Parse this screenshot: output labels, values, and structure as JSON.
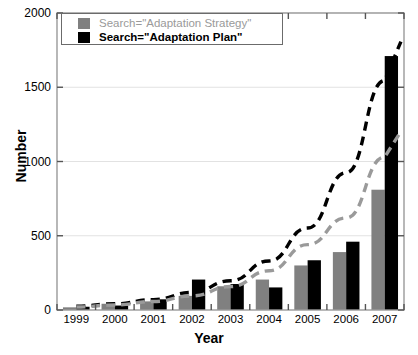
{
  "chart_data": {
    "type": "bar",
    "title": "",
    "xlabel": "Year",
    "ylabel": "Number",
    "ylim": [
      0,
      2000
    ],
    "yticks": [
      0,
      500,
      1000,
      1500,
      2000
    ],
    "ytick_labels": [
      "0",
      "500",
      "1000",
      "1500",
      "2000"
    ],
    "grid": true,
    "legend_position": "top-left",
    "categories": [
      "1999",
      "2000",
      "2001",
      "2002",
      "2003",
      "2004",
      "2005",
      "2006",
      "2007"
    ],
    "series": [
      {
        "name": "Search=\"Adaptation Strategy\"",
        "color": "#808080",
        "values": [
          18,
          42,
          58,
          95,
          160,
          205,
          300,
          390,
          810
        ]
      },
      {
        "name": "Search=\"Adaptation Plan\"",
        "color": "#000000",
        "values": [
          22,
          30,
          72,
          205,
          175,
          152,
          335,
          460,
          1710
        ]
      }
    ],
    "trendlines": [
      {
        "name": "Adaptation Plan trend",
        "color": "#000000",
        "style": "dashed",
        "x": [
          "1999",
          "2000",
          "2001",
          "2002",
          "2003",
          "2004",
          "2005",
          "2006",
          "2007"
        ],
        "values": [
          25,
          42,
          70,
          118,
          197,
          330,
          552,
          924,
          1546
        ]
      },
      {
        "name": "Adaptation Strategy trend",
        "color": "#9a9a9a",
        "style": "dashed",
        "x": [
          "1999",
          "2000",
          "2001",
          "2002",
          "2003",
          "2004",
          "2005",
          "2006",
          "2007"
        ],
        "values": [
          20,
          34,
          57,
          95,
          158,
          264,
          440,
          620,
          1030
        ]
      }
    ]
  },
  "legend": {
    "items": [
      {
        "label": "Search=\"Adaptation Strategy\"",
        "color": "#808080"
      },
      {
        "label": "Search=\"Adaptation Plan\"",
        "color": "#000000"
      }
    ]
  },
  "axes": {
    "ylabel": "Number",
    "xlabel": "Year"
  }
}
